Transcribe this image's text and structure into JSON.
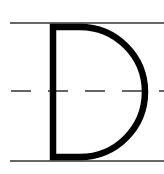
{
  "letter": "D",
  "colors": {
    "ink": "#000000",
    "guide": "#333333",
    "background": "#ffffff"
  },
  "guides": {
    "top_y": 23,
    "middle_y": 91,
    "bottom_y": 161
  }
}
